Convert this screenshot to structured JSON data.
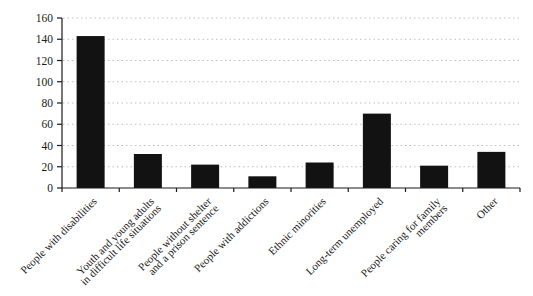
{
  "chart_data": {
    "type": "bar",
    "categories": [
      "People with disabilities",
      "Youth and young adults\nin difficult life situations",
      "People without shelter\nand a prison sentence",
      "People with addictions",
      "Ethnic minorities",
      "Long-term unemployed",
      "People caring for family\nmembers",
      "Other"
    ],
    "values": [
      143,
      32,
      22,
      11,
      24,
      70,
      21,
      34
    ],
    "title": "",
    "xlabel": "",
    "ylabel": "",
    "ylim": [
      0,
      160
    ],
    "ytick_step": 20,
    "yticks": [
      0,
      20,
      40,
      60,
      80,
      100,
      120,
      140,
      160
    ],
    "grid": "horizontal-dotted",
    "legend": "none",
    "colors": {
      "bar": "#121212",
      "axis": "#1a1a1a",
      "gridline": "#bfbfbf",
      "text": "#1a1a1a",
      "background": "#ffffff"
    }
  }
}
